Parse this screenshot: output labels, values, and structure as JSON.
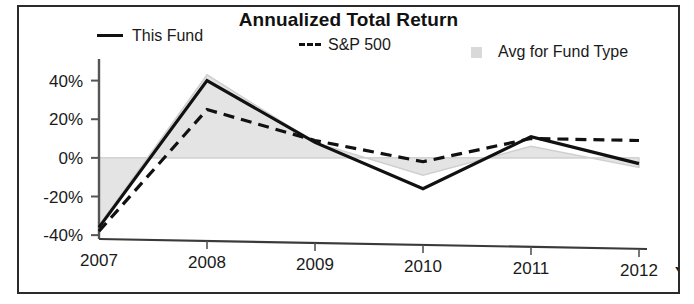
{
  "chart_data": {
    "type": "line",
    "title": "Annualized Total Return",
    "xlabel": "",
    "ylabel": "",
    "x": [
      "2007",
      "2008",
      "2009",
      "2010",
      "2011",
      "2012"
    ],
    "categories": [
      "2007",
      "2008",
      "2009",
      "2010",
      "2011",
      "2012"
    ],
    "ylim": [
      -42,
      46
    ],
    "yticks": [
      40,
      20,
      0,
      -20,
      -40
    ],
    "ytick_labels": [
      "40%",
      "20%",
      "0%",
      "-20%",
      "-40%"
    ],
    "grid": false,
    "legend_position": "top",
    "x_axis_suffix": "YTD",
    "series": [
      {
        "name": "This Fund",
        "style": "solid",
        "color": "#111111",
        "values": [
          -36,
          40,
          8,
          -16,
          11,
          -3
        ]
      },
      {
        "name": "S&P 500",
        "style": "dashed",
        "color": "#111111",
        "values": [
          -38,
          25,
          9,
          -2,
          10,
          9
        ]
      },
      {
        "name": "Avg for Fund Type",
        "style": "area",
        "color": "#e2e2e2",
        "values": [
          -35,
          43,
          8,
          -9,
          6,
          -5
        ]
      }
    ],
    "annotations": []
  },
  "legend": {
    "this_fund": "This Fund",
    "sp500": "S&P 500",
    "avg_fund_type": "Avg for Fund Type"
  },
  "axis": {
    "ytd": "YTD"
  },
  "colors": {
    "line": "#111111",
    "area_fill": "#e4e4e4",
    "area_stroke": "#cfcfcf",
    "axis": "#555555",
    "frame": "#2b2b2b",
    "swatch": "#d9d9d9"
  }
}
